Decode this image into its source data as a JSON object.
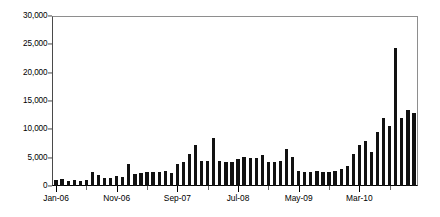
{
  "chart_data": {
    "type": "bar",
    "title": "",
    "subtitle": "",
    "xlabel": "",
    "ylabel": "",
    "ylim": [
      0,
      30000
    ],
    "ytick_values": [
      0,
      5000,
      10000,
      15000,
      20000,
      25000,
      30000
    ],
    "ytick_labels": [
      "0",
      "5,000",
      "10,000",
      "15,000",
      "20,000",
      "25,000",
      "30,000"
    ],
    "grid": false,
    "legend": null,
    "bar_color": "#111111",
    "axis_color": "#000000",
    "xtick_labels": [
      "Jan-06",
      "Nov-06",
      "Sep-07",
      "Jul-08",
      "May-09",
      "Mar-10"
    ],
    "xtick_label_indices": [
      0,
      10,
      20,
      30,
      40,
      50
    ],
    "xtick_minor_interval": 5,
    "categories": [
      "Jan-06",
      "Feb-06",
      "Mar-06",
      "Apr-06",
      "May-06",
      "Jun-06",
      "Jul-06",
      "Aug-06",
      "Sep-06",
      "Oct-06",
      "Nov-06",
      "Dec-06",
      "Jan-07",
      "Feb-07",
      "Mar-07",
      "Apr-07",
      "May-07",
      "Jun-07",
      "Jul-07",
      "Aug-07",
      "Sep-07",
      "Oct-07",
      "Nov-07",
      "Dec-07",
      "Jan-08",
      "Feb-08",
      "Mar-08",
      "Apr-08",
      "May-08",
      "Jun-08",
      "Jul-08",
      "Aug-08",
      "Sep-08",
      "Oct-08",
      "Nov-08",
      "Dec-08",
      "Jan-09",
      "Feb-09",
      "Mar-09",
      "Apr-09",
      "May-09",
      "Jun-09",
      "Jul-09",
      "Aug-09",
      "Sep-09",
      "Oct-09",
      "Nov-09",
      "Dec-09",
      "Jan-10",
      "Feb-10",
      "Mar-10",
      "Apr-10",
      "May-10",
      "Jun-10",
      "Jul-10",
      "Aug-10"
    ],
    "values": [
      1100,
      1200,
      900,
      1000,
      850,
      1000,
      2400,
      1900,
      1500,
      1500,
      1700,
      1600,
      3900,
      2100,
      2300,
      2400,
      2400,
      2500,
      2600,
      2300,
      3900,
      4200,
      5600,
      7300,
      4500,
      4400,
      8500,
      4500,
      4200,
      4300,
      4800,
      5100,
      4900,
      5000,
      5500,
      4300,
      4200,
      4500,
      6500,
      5200,
      2700,
      2400,
      2400,
      2600,
      2500,
      2500,
      2600,
      3000,
      3600,
      5600,
      7200,
      8000,
      6000,
      9500,
      12000,
      10700
    ],
    "values_tail": [
      24500,
      12000,
      13500,
      13000
    ]
  }
}
